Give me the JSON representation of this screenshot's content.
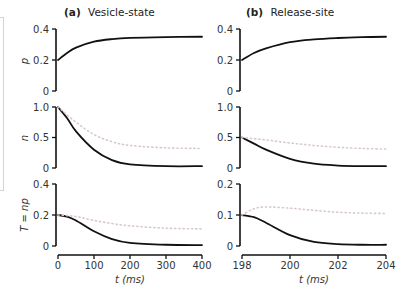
{
  "chart_data": [
    {
      "type": "line",
      "panel": "(a)",
      "title": "Vesicle-state",
      "xlabel": "t (ms)",
      "x_ticks": [
        0,
        100,
        200,
        300,
        400
      ],
      "xlim": [
        0,
        400
      ],
      "rows": [
        {
          "ylabel": "p",
          "ylim": [
            0,
            0.4
          ],
          "y_ticks": [
            "0",
            "0.2",
            "0.4"
          ],
          "series": [
            {
              "name": "p (solid)",
              "style": "solid",
              "x": [
                0,
                25,
                50,
                100,
                150,
                200,
                300,
                400
              ],
              "y": [
                0.2,
                0.245,
                0.28,
                0.318,
                0.335,
                0.343,
                0.348,
                0.35
              ]
            }
          ]
        },
        {
          "ylabel": "n",
          "ylim": [
            0,
            1.0
          ],
          "y_ticks": [
            "0",
            "0.5",
            "1.0"
          ],
          "series": [
            {
              "name": "n (solid)",
              "style": "solid",
              "x": [
                0,
                25,
                50,
                100,
                150,
                200,
                300,
                400
              ],
              "y": [
                1.0,
                0.82,
                0.6,
                0.3,
                0.13,
                0.06,
                0.03,
                0.03
              ]
            },
            {
              "name": "n (dotted)",
              "style": "dotted",
              "x": [
                0,
                50,
                100,
                150,
                200,
                300,
                400
              ],
              "y": [
                1.0,
                0.75,
                0.55,
                0.43,
                0.37,
                0.33,
                0.32
              ]
            }
          ]
        },
        {
          "ylabel": "T = np",
          "ylim": [
            0,
            0.4
          ],
          "y_ticks": [
            "0",
            "0.2",
            "0.4"
          ],
          "series": [
            {
              "name": "T (solid)",
              "style": "solid",
              "x": [
                0,
                25,
                50,
                100,
                150,
                200,
                300,
                400
              ],
              "y": [
                0.2,
                0.19,
                0.165,
                0.095,
                0.045,
                0.02,
                0.008,
                0.006
              ]
            },
            {
              "name": "T (dotted)",
              "style": "dotted",
              "x": [
                0,
                50,
                100,
                150,
                200,
                300,
                400
              ],
              "y": [
                0.2,
                0.19,
                0.165,
                0.145,
                0.13,
                0.115,
                0.11
              ]
            }
          ]
        }
      ]
    },
    {
      "type": "line",
      "panel": "(b)",
      "title": "Release-site",
      "xlabel": "t (ms)",
      "x_ticks": [
        198,
        200,
        202,
        204
      ],
      "xlim": [
        198,
        204
      ],
      "rows": [
        {
          "ylabel": "",
          "ylim": [
            0,
            0.4
          ],
          "y_ticks": [
            "0",
            "0.2",
            "0.4"
          ],
          "series": [
            {
              "name": "p (solid)",
              "style": "solid",
              "x": [
                198,
                198.5,
                199,
                200,
                201,
                202,
                203,
                204
              ],
              "y": [
                0.2,
                0.245,
                0.275,
                0.315,
                0.333,
                0.342,
                0.347,
                0.35
              ]
            }
          ]
        },
        {
          "ylabel": "",
          "ylim": [
            0,
            1.0
          ],
          "y_ticks": [
            "0",
            "0.5",
            "1.0"
          ],
          "series": [
            {
              "name": "n (solid)",
              "style": "solid",
              "x": [
                198,
                198.5,
                199,
                200,
                201,
                202,
                203,
                204
              ],
              "y": [
                0.5,
                0.4,
                0.3,
                0.15,
                0.07,
                0.04,
                0.03,
                0.03
              ]
            },
            {
              "name": "n (dotted)",
              "style": "dotted",
              "x": [
                198,
                199,
                200,
                201,
                202,
                203,
                204
              ],
              "y": [
                0.5,
                0.46,
                0.41,
                0.37,
                0.34,
                0.32,
                0.31
              ]
            }
          ]
        },
        {
          "ylabel": "",
          "ylim": [
            0,
            0.2
          ],
          "y_ticks": [
            "0",
            "0.1",
            "0.2"
          ],
          "series": [
            {
              "name": "T (solid)",
              "style": "solid",
              "x": [
                198,
                198.5,
                199,
                200,
                201,
                202,
                203,
                204
              ],
              "y": [
                0.1,
                0.093,
                0.075,
                0.035,
                0.013,
                0.006,
                0.004,
                0.004
              ]
            },
            {
              "name": "T (dotted)",
              "style": "dotted",
              "x": [
                198,
                198.5,
                199,
                200,
                201,
                202,
                203,
                204
              ],
              "y": [
                0.1,
                0.12,
                0.126,
                0.122,
                0.115,
                0.109,
                0.106,
                0.105
              ]
            }
          ]
        }
      ]
    }
  ],
  "labels": {
    "panel_a_tag": "(a)",
    "panel_a_title": "Vesicle-state",
    "panel_b_tag": "(b)",
    "panel_b_title": "Release-site",
    "ylabel_p": "p",
    "ylabel_n": "n",
    "ylabel_T": "T = np",
    "xlabel": "t (ms)"
  },
  "colors": {
    "solid_line": "#111111",
    "dotted_line": "#d9c8cc",
    "axis": "#111111"
  }
}
